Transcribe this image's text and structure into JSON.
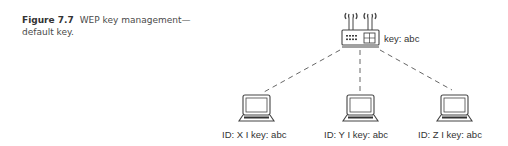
{
  "caption": {
    "figure_label": "Figure 7.7",
    "text": "WEP key management—default key."
  },
  "access_point": {
    "icon": "wireless-router-icon",
    "label": "key: abc"
  },
  "clients": [
    {
      "icon": "laptop-icon",
      "label": "ID: X I key: abc"
    },
    {
      "icon": "laptop-icon",
      "label": "ID: Y I key: abc"
    },
    {
      "icon": "laptop-icon",
      "label": "ID: Z I key: abc"
    }
  ],
  "colors": {
    "stroke": "#444444",
    "dashed_link": "#555555",
    "text": "#333333"
  }
}
